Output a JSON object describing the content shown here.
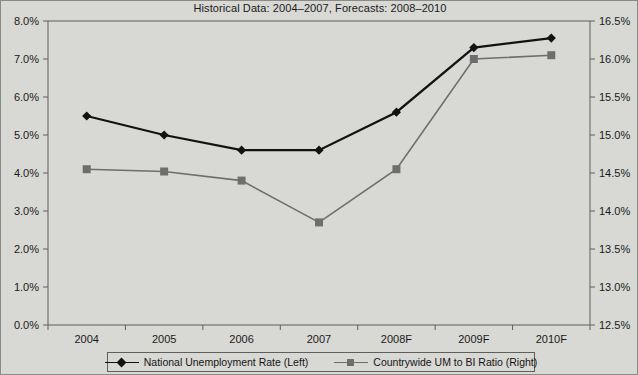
{
  "chart_data": {
    "type": "line",
    "title": "Historical Data: 2004–2007, Forecasts: 2008–2010",
    "xlabel": "",
    "ylabel": "",
    "grid": false,
    "legend_position": "bottom",
    "categories": [
      "2004",
      "2005",
      "2006",
      "2007",
      "2008F",
      "2009F",
      "2010F"
    ],
    "axes": {
      "left": {
        "label": "",
        "ylim": [
          0.0,
          8.0
        ],
        "tick_step": 1.0,
        "tick_labels": [
          "0.0%",
          "1.0%",
          "2.0%",
          "3.0%",
          "4.0%",
          "5.0%",
          "6.0%",
          "7.0%",
          "8.0%"
        ],
        "tick_values": [
          0.0,
          1.0,
          2.0,
          3.0,
          4.0,
          5.0,
          6.0,
          7.0,
          8.0
        ]
      },
      "right": {
        "label": "",
        "ylim": [
          12.5,
          16.5
        ],
        "tick_step": 0.5,
        "tick_labels": [
          "12.5%",
          "13.0%",
          "13.5%",
          "14.0%",
          "14.5%",
          "15.0%",
          "15.5%",
          "16.0%",
          "16.5%"
        ],
        "tick_values": [
          12.5,
          13.0,
          13.5,
          14.0,
          14.5,
          15.0,
          15.5,
          16.0,
          16.5
        ]
      }
    },
    "series": [
      {
        "name": "National Unemployment Rate (Left)",
        "axis": "left",
        "color": "#121212",
        "marker": "diamond",
        "values": [
          5.5,
          5.0,
          4.6,
          4.6,
          5.6,
          7.3,
          7.55
        ]
      },
      {
        "name": "Countrywide UM to BI Ratio (Right)",
        "axis": "right",
        "color": "#6e6e6e",
        "marker": "square",
        "values": [
          14.55,
          14.52,
          14.4,
          13.85,
          14.55,
          16.0,
          16.05
        ]
      }
    ]
  },
  "legend": {
    "entries": [
      {
        "label": "National Unemployment Rate (Left)",
        "marker": "diamond-marker",
        "color": "#121212"
      },
      {
        "label": "Countrywide UM to BI Ratio (Right)",
        "marker": "square-marker",
        "color": "#6e6e6e"
      }
    ]
  },
  "colors": {
    "background": "#d8d8d4",
    "axis": "#5e5e5a",
    "text": "#1a1a1a",
    "series_primary": "#121212",
    "series_secondary": "#6e6e6e"
  }
}
